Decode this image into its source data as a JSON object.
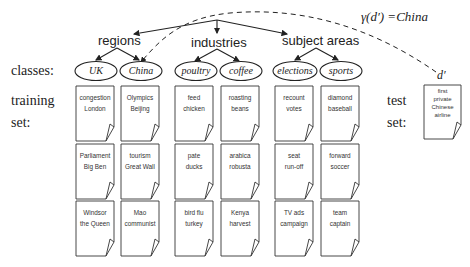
{
  "hierarchy": {
    "categories": [
      {
        "label": "regions"
      },
      {
        "label": "industries"
      },
      {
        "label": "subject areas"
      }
    ],
    "classes": [
      {
        "label": "UK"
      },
      {
        "label": "China"
      },
      {
        "label": "poultry"
      },
      {
        "label": "coffee"
      },
      {
        "label": "elections"
      },
      {
        "label": "sports"
      }
    ]
  },
  "side_labels": {
    "classes": "classes:",
    "training": "training",
    "training_set": "set:",
    "test": "test",
    "test_set": "set:"
  },
  "training_docs": [
    [
      {
        "l1": "congestion",
        "l2": "London"
      },
      {
        "l1": "Parliament",
        "l2": "Big Ben"
      },
      {
        "l1": "Windsor",
        "l2": "the Queen"
      }
    ],
    [
      {
        "l1": "Olympics",
        "l2": "Beijing"
      },
      {
        "l1": "tourism",
        "l2": "Great Wall"
      },
      {
        "l1": "Mao",
        "l2": "communist"
      }
    ],
    [
      {
        "l1": "feed",
        "l2": "chicken"
      },
      {
        "l1": "pate",
        "l2": "ducks"
      },
      {
        "l1": "bird flu",
        "l2": "turkey"
      }
    ],
    [
      {
        "l1": "roasting",
        "l2": "beans"
      },
      {
        "l1": "arabica",
        "l2": "robusta"
      },
      {
        "l1": "Kenya",
        "l2": "harvest"
      }
    ],
    [
      {
        "l1": "recount",
        "l2": "votes"
      },
      {
        "l1": "seat",
        "l2": "run-off"
      },
      {
        "l1": "TV ads",
        "l2": "campaign"
      }
    ],
    [
      {
        "l1": "diamond",
        "l2": "baseball"
      },
      {
        "l1": "forward",
        "l2": "soccer"
      },
      {
        "l1": "team",
        "l2": "captain"
      }
    ]
  ],
  "test_doc": {
    "label": "d′",
    "l1": "first",
    "l2": "private",
    "l3": "Chinese",
    "l4": "airline"
  },
  "formula": "γ(d′) =China",
  "colors": {
    "ink": "#222222",
    "doc_border": "#333333"
  }
}
